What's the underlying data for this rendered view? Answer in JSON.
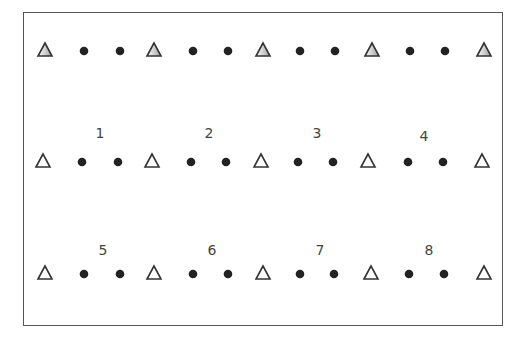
{
  "diagram": {
    "frame": {
      "x": 23,
      "y": 12,
      "w": 480,
      "h": 314,
      "color": "#555555"
    },
    "rows": [
      {
        "y": 50,
        "triangle_fill": "gray",
        "label": null,
        "triangles_x": [
          45,
          154,
          263,
          372,
          484
        ],
        "dots_x": [
          84,
          120,
          193,
          228,
          300,
          335,
          410,
          445
        ]
      },
      {
        "y": 161,
        "triangle_fill": "white",
        "triangles_x": [
          43,
          152,
          261,
          368,
          482
        ],
        "dots_x": [
          82,
          118,
          191,
          226,
          298,
          333,
          408,
          443
        ]
      },
      {
        "y": 273,
        "triangle_fill": "white",
        "triangles_x": [
          45,
          154,
          263,
          371,
          484
        ],
        "dots_x": [
          84,
          120,
          193,
          228,
          300,
          334,
          409,
          444
        ]
      }
    ],
    "labels": [
      {
        "text": "1",
        "x": 100,
        "y": 133
      },
      {
        "text": "2",
        "x": 209,
        "y": 133
      },
      {
        "text": "3",
        "x": 317,
        "y": 133
      },
      {
        "text": "4",
        "x": 424,
        "y": 136
      },
      {
        "text": "5",
        "x": 103,
        "y": 250
      },
      {
        "text": "6",
        "x": 212,
        "y": 250
      },
      {
        "text": "7",
        "x": 320,
        "y": 250
      },
      {
        "text": "8",
        "x": 429,
        "y": 250
      }
    ],
    "colors": {
      "dot": "#222222",
      "triangle_stroke": "#333333",
      "triangle_gray": "#b0b0b0",
      "label": "#444444"
    }
  }
}
